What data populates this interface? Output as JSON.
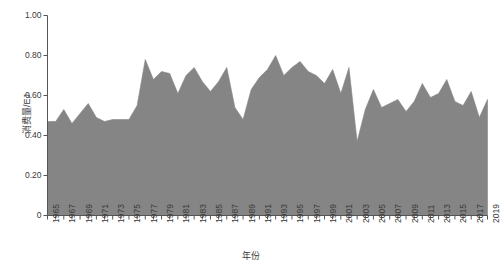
{
  "chart_data": {
    "type": "area",
    "title": "",
    "xlabel": "年份",
    "ylabel": "消费量/EJ",
    "grid": false,
    "legend": null,
    "xlim": [
      1965,
      2019
    ],
    "ylim": [
      0,
      1.0
    ],
    "y_ticks": [
      0,
      0.2,
      0.4,
      0.6,
      0.8,
      1.0
    ],
    "y_tick_labels": [
      "0",
      "0.20",
      "0.40",
      "0.60",
      "0.80",
      "1.00"
    ],
    "x_tick_labels": [
      "1965",
      "1967",
      "1969",
      "1971",
      "1973",
      "1975",
      "1977",
      "1979",
      "1981",
      "1983",
      "1985",
      "1987",
      "1989",
      "1991",
      "1993",
      "1995",
      "1997",
      "1999",
      "2001",
      "2003",
      "2005",
      "2007",
      "2009",
      "2011",
      "2013",
      "2015",
      "2017",
      "2019"
    ],
    "x_tick_step": 2,
    "x_minor_tick_step": 1,
    "series": [
      {
        "name": "消费量",
        "fill_color": "#858585",
        "line_color": "#858585",
        "x": [
          1965,
          1966,
          1967,
          1968,
          1969,
          1970,
          1971,
          1972,
          1973,
          1974,
          1975,
          1976,
          1977,
          1978,
          1979,
          1980,
          1981,
          1982,
          1983,
          1984,
          1985,
          1986,
          1987,
          1988,
          1989,
          1990,
          1991,
          1992,
          1993,
          1994,
          1995,
          1996,
          1997,
          1998,
          1999,
          2000,
          2001,
          2002,
          2003,
          2004,
          2005,
          2006,
          2007,
          2008,
          2009,
          2010,
          2011,
          2012,
          2013,
          2014,
          2015,
          2016,
          2017,
          2018,
          2019
        ],
        "values": [
          0.47,
          0.47,
          0.53,
          0.46,
          0.51,
          0.56,
          0.49,
          0.47,
          0.48,
          0.48,
          0.48,
          0.55,
          0.78,
          0.68,
          0.72,
          0.71,
          0.61,
          0.7,
          0.74,
          0.67,
          0.62,
          0.67,
          0.74,
          0.54,
          0.48,
          0.63,
          0.69,
          0.73,
          0.8,
          0.7,
          0.74,
          0.77,
          0.72,
          0.7,
          0.66,
          0.73,
          0.61,
          0.74,
          0.37,
          0.53,
          0.63,
          0.54,
          0.56,
          0.58,
          0.52,
          0.57,
          0.66,
          0.59,
          0.61,
          0.68,
          0.57,
          0.55,
          0.62,
          0.49,
          0.58
        ]
      }
    ]
  },
  "axes": {
    "y_label": "消费量/EJ",
    "x_label": "年份"
  }
}
